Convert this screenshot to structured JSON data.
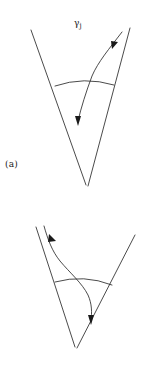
{
  "figure": {
    "background_color": "#ffffff",
    "stroke_color": "#2b2b2b",
    "text_color": "#1a1a1a",
    "panels": [
      {
        "id": "a",
        "caption": "(a)",
        "curve_label": "γ",
        "curve_label_subscript": "j",
        "elements": {
          "left_wedge_label": "left-cone-boundary",
          "right_wedge_label": "right-cone-boundary",
          "transversal_label": "transversal-arc",
          "trajectory_label": "trajectory-curve",
          "entry_arrow_label": "entry-arrow",
          "exit_arrow_label": "exit-arrow"
        }
      },
      {
        "id": "b",
        "caption": "(b)",
        "curve_label": "γ",
        "curve_label_subscript": "j",
        "elements": {
          "left_wedge_label": "left-cone-boundary",
          "right_wedge_label": "right-cone-boundary",
          "transversal_label": "transversal-arc",
          "trajectory_label": "trajectory-curve",
          "entry_arrow_label": "entry-arrow",
          "exit_arrow_label": "exit-arrow"
        }
      }
    ]
  }
}
